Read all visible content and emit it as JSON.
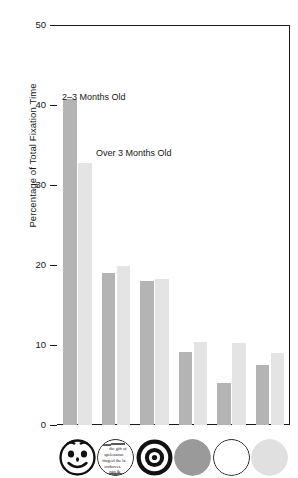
{
  "chart_data": {
    "type": "bar",
    "title": "",
    "xlabel": "",
    "ylabel": "Percentage of Total Fixation Time",
    "ylim": [
      0,
      50
    ],
    "yticks": [
      0,
      10,
      20,
      30,
      40,
      50
    ],
    "ytick_labels": [
      "0",
      "10",
      "20",
      "30",
      "40",
      "50"
    ],
    "grid": false,
    "legend_position": "inside-plot-annotations",
    "categories": [
      "face",
      "newsprint",
      "bullseye",
      "red disc",
      "white disc",
      "yellow disc"
    ],
    "category_icons": [
      "smiley-face-icon",
      "newsprint-circle-icon",
      "bullseye-icon",
      "gray-disc-icon",
      "white-disc-icon",
      "light-gray-disc-icon"
    ],
    "series": [
      {
        "name": "2-3 Months Old",
        "color": "#b4b4b4",
        "values": [
          40.7,
          19.0,
          18.0,
          9.1,
          5.3,
          7.5
        ]
      },
      {
        "name": "Over 3 Months Old",
        "color": "#e4e4e4",
        "values": [
          32.7,
          19.9,
          18.3,
          10.4,
          10.3,
          9.0
        ]
      }
    ],
    "annotations": [
      {
        "text": "2–3 Months Old",
        "series": "2-3 Months Old"
      },
      {
        "text": "Over 3 Months Old",
        "series": "Over 3 Months Old"
      }
    ]
  },
  "axis": {
    "ylabel": "Percentage of Total Fixation Time",
    "ticks": [
      {
        "label": "50",
        "value": 50
      },
      {
        "label": "40",
        "value": 40
      },
      {
        "label": "30",
        "value": 30
      },
      {
        "label": "20",
        "value": 20
      },
      {
        "label": "10",
        "value": 10
      },
      {
        "label": "0",
        "value": 0
      }
    ]
  },
  "annotations": {
    "first": "2–Months Old",
    "legend_young": "2–3 Months Old",
    "legend_older": "Over 3 Months Old"
  },
  "newsprint": {
    "words": [
      "the gift of",
      "spelenaroo",
      "fingeol the la",
      "orchoves.",
      "nan &"
    ]
  },
  "colors": {
    "series_young": "#b4b4b4",
    "series_older": "#e4e4e4",
    "axis": "#1a1a1a",
    "disc_red": "#9a9a9a",
    "disc_white": "#ffffff",
    "disc_yellow": "#e0e0e0",
    "background": "#ffffff"
  }
}
